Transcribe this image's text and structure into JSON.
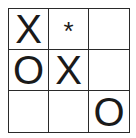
{
  "game": {
    "type": "tic-tac-toe",
    "board": [
      [
        "X",
        "*",
        ""
      ],
      [
        "O",
        "X",
        ""
      ],
      [
        "",
        "",
        "O"
      ]
    ],
    "cells": {
      "r0c0": "X",
      "r0c1": "*",
      "r0c2": "",
      "r1c0": "O",
      "r1c1": "X",
      "r1c2": "",
      "r2c0": "",
      "r2c1": "",
      "r2c2": "O"
    },
    "colors": {
      "grid": "#2a2a2a",
      "mark": "#1a1a1a",
      "background": "#ffffff"
    }
  }
}
